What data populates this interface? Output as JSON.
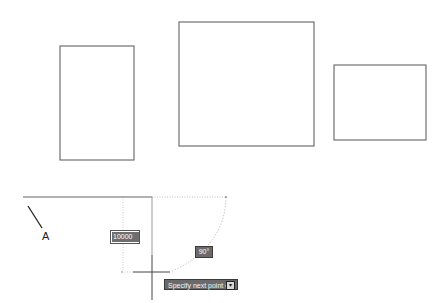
{
  "drawing": {
    "rectangles": [
      {
        "name": "rect-left",
        "x": 60,
        "y": 46,
        "w": 74,
        "h": 114
      },
      {
        "name": "rect-middle",
        "x": 179,
        "y": 22,
        "w": 135,
        "h": 124
      },
      {
        "name": "rect-right",
        "x": 334,
        "y": 65,
        "w": 92,
        "h": 75
      }
    ],
    "stroke_color": "#555555",
    "tracking_color": "#bdbdbd"
  },
  "annotation": {
    "point_label": "A"
  },
  "dynamic_input": {
    "distance_value": "10000",
    "angle_value": "90°",
    "prompt_text": "Specify next point or",
    "prompt_dropdown_icon": "down-arrow-icon"
  }
}
